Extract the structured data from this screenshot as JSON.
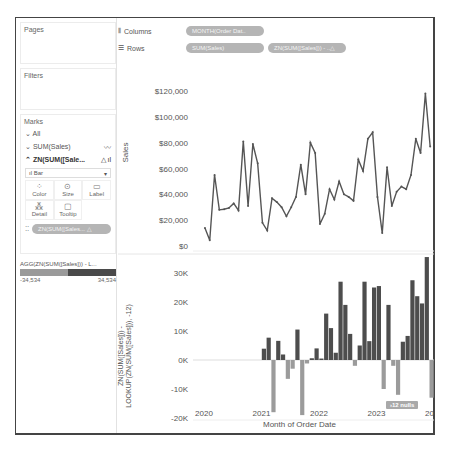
{
  "shelves": {
    "pages_label": "Pages",
    "filters_label": "Filters",
    "columns_label": "Columns",
    "rows_label": "Rows",
    "columns_pills": [
      "MONTH(Order Dat.."
    ],
    "rows_pills": [
      "SUM(Sales)",
      "ZN(SUM([Sales])) - ..△"
    ]
  },
  "marks": {
    "title": "Marks",
    "all_label": "All",
    "sum_sales_label": "SUM(Sales)",
    "zn_label": "ZN(SUM([Sale...",
    "mark_type": "Bar",
    "buttons": [
      "Color",
      "Size",
      "Label",
      "Detail",
      "Tooltip"
    ],
    "field_pill": "ZN(SUM([Sales... △"
  },
  "legend": {
    "title": "AGG(ZN(SUM([Sales])) - L...",
    "min": "-34,534",
    "max": "34,534",
    "neg_color": "#9a9a9a",
    "pos_color": "#4a4a4a"
  },
  "colors": {
    "line": "#555555",
    "bar_pos": "#4d4d4d",
    "bar_neg": "#9b9b9b",
    "grid_zero": "#dddddd"
  },
  "nulls_badge": "12 nulls",
  "chart_data": [
    {
      "type": "line",
      "title": "",
      "xlabel": "Month of Order Date",
      "ylabel": "Sales",
      "ylim": [
        0,
        120000
      ],
      "yticks": [
        "$0",
        "$20,000",
        "$40,000",
        "$60,000",
        "$80,000",
        "$100,000",
        "$120,000"
      ],
      "xticks": [
        "2020",
        "2021",
        "2022",
        "2023",
        "2024"
      ],
      "x_start": "2020-01",
      "x_end": "2023-12",
      "series": [
        {
          "name": "SUM(Sales)",
          "values": [
            14000,
            4500,
            55000,
            28000,
            28500,
            29500,
            33000,
            27500,
            81000,
            31000,
            79000,
            64000,
            18000,
            12000,
            37000,
            34000,
            30000,
            23000,
            30000,
            38000,
            63000,
            40000,
            80000,
            72000,
            17000,
            25000,
            44000,
            36000,
            50000,
            40000,
            38000,
            35000,
            67000,
            58000,
            83000,
            88000,
            38000,
            10000,
            61000,
            31000,
            42000,
            46000,
            44000,
            55000,
            83000,
            72000,
            118000,
            77000
          ]
        }
      ]
    },
    {
      "type": "bar",
      "title": "",
      "xlabel": "Month of Order Date",
      "ylabel": "ZN(SUM([Sales])) - LOOKUP(ZN(SUM([Sales])), -12)",
      "ylim": [
        -20000,
        35000
      ],
      "yticks": [
        "-20K",
        "-10K",
        "0K",
        "10K",
        "20K",
        "30K"
      ],
      "xticks": [
        "2020",
        "2021",
        "2022",
        "2023",
        "2024"
      ],
      "x_start": "2021-01",
      "x_end": "2023-12",
      "nulls": 12,
      "series": [
        {
          "name": "YoY Difference",
          "values": [
            3900,
            7700,
            -18000,
            6600,
            1900,
            -6500,
            -3000,
            10500,
            -19000,
            -1200,
            600,
            4000,
            500,
            16000,
            11000,
            2500,
            27000,
            19000,
            9000,
            -2000,
            5000,
            27000,
            6500,
            25000,
            25500,
            -10000,
            19000,
            -2000,
            -12000,
            6300,
            8300,
            27500,
            22000,
            19500,
            35500,
            -13000
          ]
        }
      ]
    }
  ]
}
